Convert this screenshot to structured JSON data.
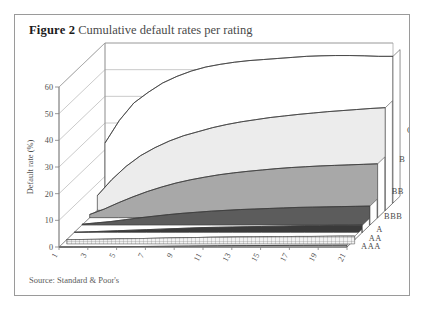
{
  "figure": {
    "label": "Figure 2",
    "title": "Cumulative default rates per rating",
    "source": "Source: Standard & Poor's"
  },
  "chart_data": {
    "type": "area",
    "title": "Cumulative default rates per rating",
    "xlabel": "Years",
    "ylabel": "Default rate (%)",
    "ylim": [
      0,
      60
    ],
    "yticks": [
      0,
      10,
      20,
      30,
      40,
      50,
      60
    ],
    "xticks": [
      1,
      3,
      5,
      7,
      9,
      11,
      13,
      15,
      17,
      19,
      21
    ],
    "x": [
      1,
      2,
      3,
      4,
      5,
      6,
      7,
      8,
      9,
      10,
      11,
      12,
      13,
      14,
      15,
      16,
      17,
      18,
      19,
      20,
      21
    ],
    "grid": true,
    "legend": "right-edge-series-labels",
    "projection": "3d-receding-ribbons",
    "series": [
      {
        "name": "CCC",
        "color": "#ffffff",
        "values": [
          22.5,
          31.0,
          37.5,
          41.5,
          45.0,
          47.5,
          49.5,
          51.0,
          52.0,
          52.8,
          53.4,
          53.8,
          54.2,
          54.6,
          55.0,
          55.2,
          55.3,
          55.3,
          55.2,
          55.0,
          55.0
        ]
      },
      {
        "name": "B",
        "color": "#ececec",
        "values": [
          5.5,
          11.5,
          16.5,
          20.5,
          23.5,
          26.0,
          28.0,
          29.5,
          31.0,
          32.2,
          33.2,
          34.0,
          34.8,
          35.4,
          36.0,
          36.5,
          37.0,
          37.4,
          37.8,
          38.2,
          38.5
        ]
      },
      {
        "name": "BB",
        "color": "#a8a8a8",
        "values": [
          1.2,
          3.2,
          5.6,
          7.8,
          9.8,
          11.5,
          13.0,
          14.2,
          15.2,
          16.1,
          16.8,
          17.4,
          17.9,
          18.4,
          18.8,
          19.1,
          19.4,
          19.6,
          19.8,
          20.0,
          20.2
        ]
      },
      {
        "name": "BBB",
        "color": "#5c5c5c",
        "values": [
          0.3,
          0.8,
          1.3,
          2.0,
          2.7,
          3.3,
          3.9,
          4.4,
          4.8,
          5.2,
          5.5,
          5.8,
          6.0,
          6.2,
          6.4,
          6.6,
          6.7,
          6.8,
          6.9,
          7.0,
          7.1
        ]
      },
      {
        "name": "A",
        "color": "#3a3a3a",
        "values": [
          0.05,
          0.2,
          0.4,
          0.6,
          0.8,
          1.0,
          1.2,
          1.4,
          1.6,
          1.8,
          1.9,
          2.0,
          2.1,
          2.2,
          2.3,
          2.4,
          2.5,
          2.5,
          2.6,
          2.6,
          2.7
        ]
      },
      {
        "name": "AA",
        "color": "#c9c9c9",
        "values": [
          0.02,
          0.06,
          0.12,
          0.2,
          0.3,
          0.4,
          0.5,
          0.6,
          0.7,
          0.8,
          0.9,
          0.95,
          1.0,
          1.05,
          1.1,
          1.15,
          1.2,
          1.2,
          1.25,
          1.3,
          1.3
        ]
      },
      {
        "name": "AAA",
        "color": "#e4e4e4",
        "values": [
          0.0,
          0.02,
          0.05,
          0.08,
          0.12,
          0.16,
          0.2,
          0.25,
          0.3,
          0.35,
          0.4,
          0.45,
          0.5,
          0.52,
          0.55,
          0.58,
          0.6,
          0.62,
          0.64,
          0.66,
          0.68
        ]
      }
    ]
  }
}
